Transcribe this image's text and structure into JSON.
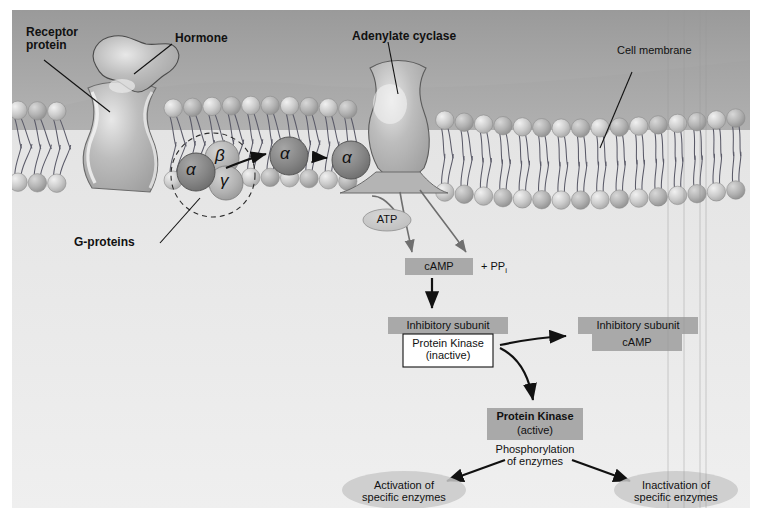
{
  "figure": {
    "background_outer": "#ffffff",
    "background_extracellular": "#a8a8a8",
    "background_cytoplasm": "#ececec",
    "membrane_head_color": "#c9c9c9",
    "protein_fill": "#b4b4b4",
    "alpha_subunit_color": "#8a8a8a",
    "beta_gamma_color": "#b0b0b0",
    "box_fill": "#a9a9a9",
    "oval_fill": "#c2c2c2",
    "ink": "#111111"
  },
  "membrane": {
    "label": "Cell membrane",
    "bold": false
  },
  "receptor": {
    "label_line1": "Receptor",
    "label_line2": "protein",
    "bold": true
  },
  "hormone": {
    "label": "Hormone",
    "bold": true
  },
  "adenylate_cyclase": {
    "label": "Adenylate cyclase",
    "bold": true
  },
  "gproteins": {
    "label": "G-proteins",
    "bold": true,
    "subunits": [
      {
        "name": "alpha-subunit",
        "glyph": "α",
        "variant": "dark"
      },
      {
        "name": "beta-subunit",
        "glyph": "β",
        "variant": "light"
      },
      {
        "name": "gamma-subunit",
        "glyph": "γ",
        "variant": "light"
      }
    ],
    "migrating": [
      {
        "name": "alpha-subunit-migrating-1",
        "glyph": "α"
      },
      {
        "name": "alpha-subunit-migrating-2",
        "glyph": "α"
      }
    ]
  },
  "substrates": {
    "atp": "ATP",
    "camp": "cAMP",
    "pyrophosphate": "+ PP",
    "pyrophosphate_sub": "i"
  },
  "kinase_inactive": {
    "inhibitory_subunit": "Inhibitory subunit",
    "name": "Protein Kinase",
    "state": "(inactive)"
  },
  "kinase_released_complex": {
    "inhibitory_subunit": "Inhibitory subunit",
    "bound": "cAMP"
  },
  "kinase_active": {
    "name": "Protein Kinase",
    "state": "(active)",
    "action_line1": "Phosphorylation",
    "action_line2": "of enzymes"
  },
  "outcomes": [
    {
      "name": "activation-outcome",
      "line1": "Activation of",
      "line2": "specific enzymes"
    },
    {
      "name": "inactivation-outcome",
      "line1": "Inactivation of",
      "line2": "specific enzymes"
    }
  ]
}
